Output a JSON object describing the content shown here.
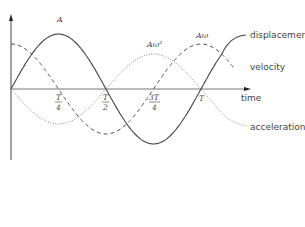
{
  "diagram": {
    "type": "simple harmonic motion graph",
    "curves": [
      {
        "name": "displacement",
        "label": "displacement",
        "style": "solid",
        "amplitude_label": "A",
        "function": "A sin(ωt)"
      },
      {
        "name": "velocity",
        "label": "velocity",
        "style": "dashed",
        "amplitude_label": "Aω",
        "function": "Aω cos(ωt)"
      },
      {
        "name": "acceleration",
        "label": "acceleration",
        "style": "dotted",
        "amplitude_label": "Aω²",
        "function": "-Aω² sin(ωt)"
      }
    ],
    "x_axis": {
      "label": "time"
    },
    "ticks": [
      {
        "num": "T",
        "den": "4"
      },
      {
        "num": "T",
        "den": "2"
      },
      {
        "num": "3T",
        "den": "4"
      },
      {
        "num": "T",
        "den": ""
      }
    ],
    "colors": {
      "lines": "#555555",
      "axis": "#444444",
      "text": "#444444"
    }
  },
  "labels": {
    "displacement": "displacement",
    "velocity": "velocity",
    "acceleration": "acceleration",
    "time": "time",
    "amp_displacement": "A",
    "amp_velocity": "Aω",
    "amp_acceleration": "Aω²",
    "tick_t4_num": "T",
    "tick_t4_den": "4",
    "tick_t2_num": "T",
    "tick_t2_den": "2",
    "tick_3t4_num": "3T",
    "tick_3t4_den": "4",
    "tick_t": "T"
  }
}
